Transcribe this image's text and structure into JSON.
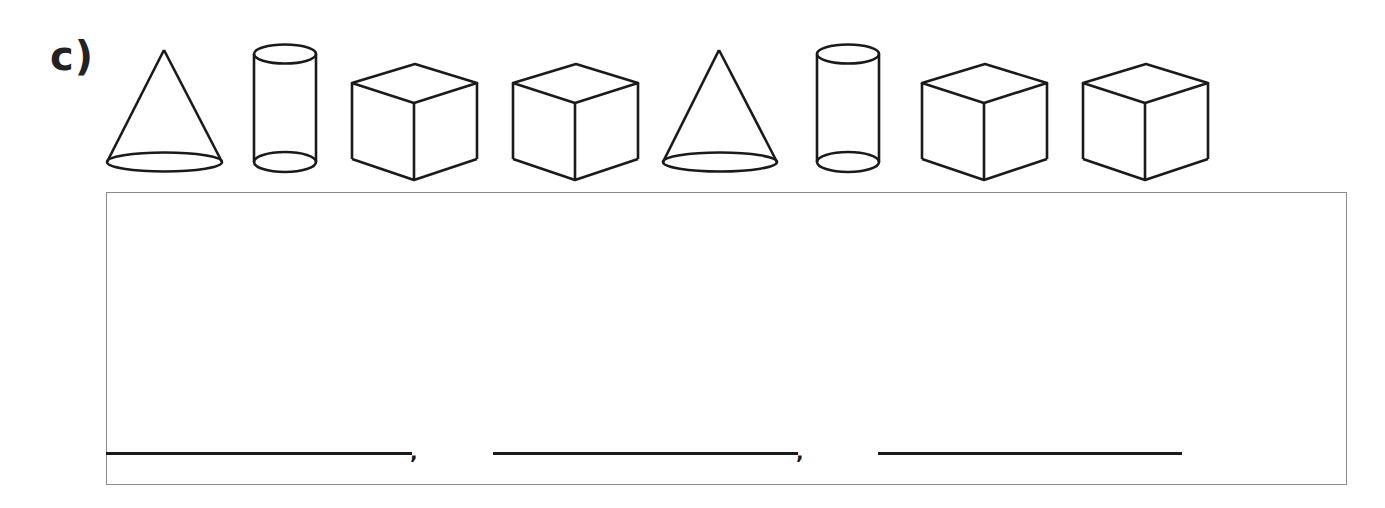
{
  "exercise": {
    "label": "c)",
    "shapes": [
      {
        "type": "cone",
        "name": "cone-1"
      },
      {
        "type": "cylinder",
        "name": "cylinder-1"
      },
      {
        "type": "cube",
        "name": "cube-1"
      },
      {
        "type": "cube",
        "name": "cube-2"
      },
      {
        "type": "cone",
        "name": "cone-2"
      },
      {
        "type": "cylinder",
        "name": "cylinder-2"
      },
      {
        "type": "cube",
        "name": "cube-3"
      },
      {
        "type": "cube",
        "name": "cube-4"
      }
    ],
    "answer": {
      "blanks": [
        "",
        "",
        ""
      ],
      "separators": [
        ",",
        ","
      ]
    }
  },
  "colors": {
    "stroke": "#1a1a1a",
    "box_border": "#8a8a8a",
    "background": "#ffffff"
  }
}
